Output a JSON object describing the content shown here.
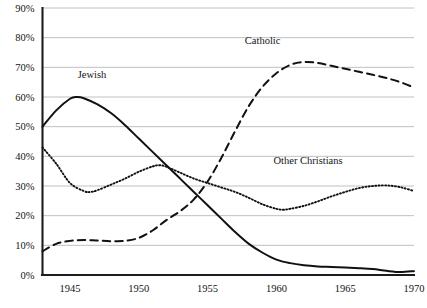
{
  "chart_data": {
    "type": "line",
    "title": "",
    "subtitle": "",
    "xlabel": "",
    "ylabel": "",
    "xlim": [
      1943,
      1970
    ],
    "ylim": [
      0,
      90
    ],
    "grid": true,
    "legend_position": "inline-annotations",
    "x_tick_labels": [
      "1945",
      "1950",
      "1955",
      "1960",
      "1965",
      "1970"
    ],
    "x_ticks": [
      1945,
      1950,
      1955,
      1960,
      1965,
      1970
    ],
    "y_tick_labels": [
      "0%",
      "10%",
      "20%",
      "30%",
      "40%",
      "50%",
      "60%",
      "70%",
      "80%",
      "90%"
    ],
    "y_ticks": [
      0,
      10,
      20,
      30,
      40,
      50,
      60,
      70,
      80,
      90
    ],
    "series": [
      {
        "name": "Jewish",
        "label": "Jewish",
        "style": "solid",
        "color": "#111111",
        "label_x": 1946.6,
        "label_y": 66.5,
        "x": [
          1943,
          1944,
          1945,
          1945.5,
          1946,
          1947,
          1948,
          1949,
          1950,
          1951,
          1952,
          1953,
          1954,
          1955,
          1956,
          1957,
          1958,
          1959,
          1960,
          1961,
          1962,
          1963,
          1964,
          1965,
          1966,
          1967,
          1968,
          1969,
          1970
        ],
        "values": [
          50,
          55.5,
          59.4,
          60,
          59.6,
          57.5,
          54.5,
          50.5,
          46,
          41.5,
          37,
          32.5,
          28,
          23.5,
          19,
          14.5,
          10.5,
          7.5,
          5.2,
          4.0,
          3.3,
          2.9,
          2.7,
          2.5,
          2.3,
          2.0,
          1.4,
          1.0,
          1.3
        ]
      },
      {
        "name": "Catholic",
        "label": "Catholic",
        "style": "dashed",
        "color": "#111111",
        "label_x": 1959.0,
        "label_y": 78.0,
        "x": [
          1943,
          1944,
          1945,
          1946,
          1947,
          1948,
          1949,
          1950,
          1951,
          1952,
          1953,
          1954,
          1955,
          1956,
          1957,
          1958,
          1959,
          1960,
          1961,
          1962,
          1963,
          1964,
          1965,
          1966,
          1967,
          1968,
          1969,
          1970
        ],
        "values": [
          8,
          10.5,
          11.5,
          11.8,
          11.6,
          11.4,
          11.5,
          12.5,
          15.0,
          18.5,
          21.5,
          25.5,
          31.5,
          39.5,
          48.5,
          57.0,
          63.5,
          68.0,
          70.8,
          71.8,
          71.5,
          70.5,
          69.5,
          68.5,
          67.5,
          66.4,
          65.0,
          63.2
        ]
      },
      {
        "name": "Other Christians",
        "label": "Other Christians",
        "style": "dotted",
        "color": "#111111",
        "label_x": 1962.3,
        "label_y": 37.5,
        "x": [
          1943,
          1944,
          1945,
          1946,
          1946.5,
          1947,
          1948,
          1949,
          1950,
          1951,
          1951.5,
          1952,
          1953,
          1954,
          1955,
          1956,
          1957,
          1958,
          1959,
          1960,
          1960.5,
          1961,
          1962,
          1963,
          1964,
          1965,
          1966,
          1967,
          1968,
          1969,
          1970
        ],
        "values": [
          43,
          37.5,
          31.0,
          28.3,
          28.0,
          28.6,
          30.5,
          32.5,
          34.8,
          36.6,
          37.0,
          36.5,
          34.5,
          32.5,
          31.0,
          29.5,
          28.0,
          26.0,
          23.8,
          22.3,
          22.0,
          22.3,
          23.3,
          24.8,
          26.5,
          28.0,
          29.3,
          30.0,
          30.2,
          29.6,
          28.3
        ]
      }
    ]
  }
}
